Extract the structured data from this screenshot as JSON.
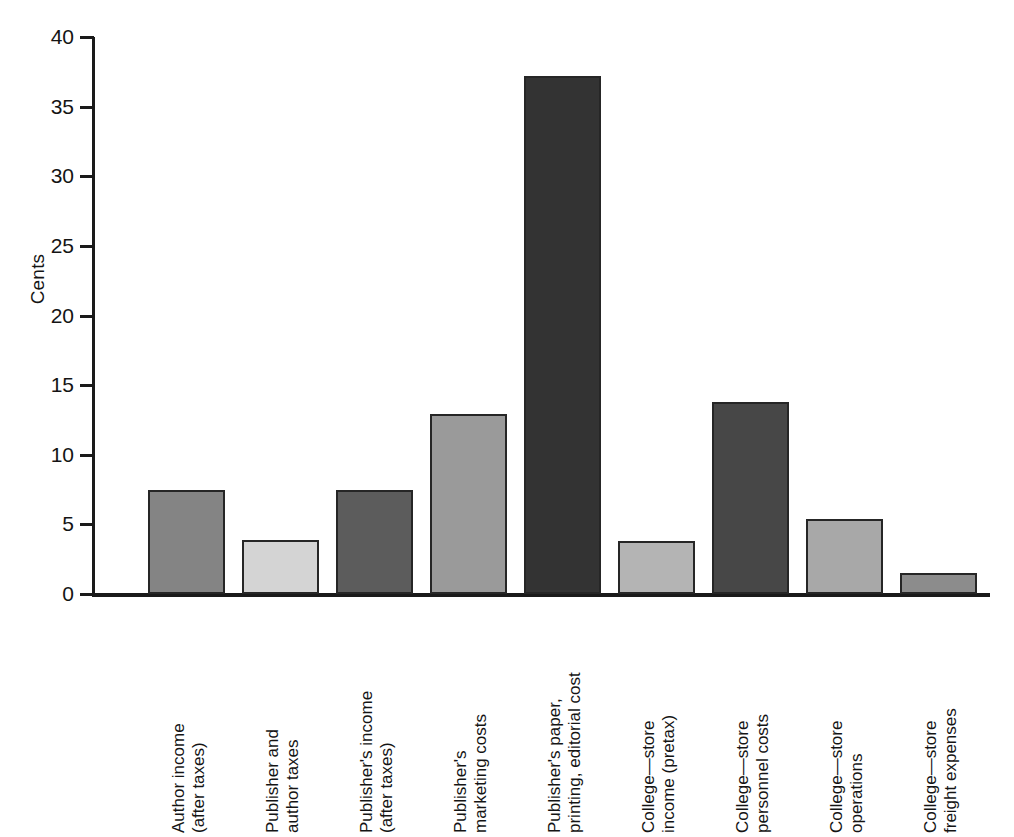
{
  "chart_data": {
    "type": "bar",
    "title": "",
    "xlabel": "",
    "ylabel": "Cents",
    "ylim": [
      0,
      40
    ],
    "ytick_values": [
      0,
      5,
      10,
      15,
      20,
      25,
      30,
      35,
      40
    ],
    "ytick_labels": [
      "0",
      "5",
      "10",
      "15",
      "20",
      "25",
      "30",
      "35",
      "40"
    ],
    "grid": false,
    "legend": "none",
    "categories": [
      "Author income (after taxes)",
      "Publisher and author taxes",
      "Publisher's income (after taxes)",
      "Publisher's marketing costs",
      "Publisher's paper, printing, editorial cost",
      "College—store income (pretax)",
      "College—store personnel costs",
      "College—store operations",
      "College—store freight expenses"
    ],
    "values": [
      7.5,
      3.9,
      7.5,
      12.9,
      37.2,
      3.8,
      13.8,
      5.4,
      1.5
    ],
    "bar_colors": [
      "#848484",
      "#d4d4d4",
      "#5c5c5c",
      "#9a9a9a",
      "#333333",
      "#b4b4b4",
      "#474747",
      "#a8a8a8",
      "#8c8c8c"
    ],
    "bar_edge_color": "#262626"
  },
  "axis": {
    "y_title": "Cents",
    "ticks": [
      {
        "label": "40",
        "value": 40
      },
      {
        "label": "35",
        "value": 35
      },
      {
        "label": "30",
        "value": 30
      },
      {
        "label": "25",
        "value": 25
      },
      {
        "label": "20",
        "value": 20
      },
      {
        "label": "15",
        "value": 15
      },
      {
        "label": "10",
        "value": 10
      },
      {
        "label": "5",
        "value": 5
      },
      {
        "label": "0",
        "value": 0
      }
    ]
  },
  "x_labels": [
    {
      "line1": "Author income",
      "line2": "(after taxes)"
    },
    {
      "line1": "Publisher and",
      "line2": "author taxes"
    },
    {
      "line1": "Publisher's income",
      "line2": "(after taxes)"
    },
    {
      "line1": "Publisher's",
      "line2": "marketing costs"
    },
    {
      "line1": "Publisher's paper,",
      "line2": "printing, editorial cost"
    },
    {
      "line1": "College—store",
      "line2": "income (pretax)"
    },
    {
      "line1": "College—store",
      "line2": "personnel costs"
    },
    {
      "line1": "College—store",
      "line2": "operations"
    },
    {
      "line1": "College—store",
      "line2": "freight expenses"
    }
  ]
}
